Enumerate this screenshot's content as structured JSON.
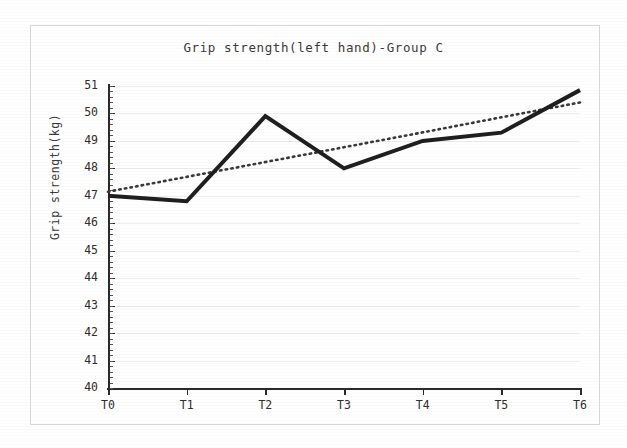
{
  "chart_data": {
    "type": "line",
    "title": "Grip strength(left hand)-Group C",
    "xlabel": "",
    "ylabel": "Grip strength(kg)",
    "categories": [
      "T0",
      "T1",
      "T2",
      "T3",
      "T4",
      "T5",
      "T6"
    ],
    "ylim": [
      40,
      51
    ],
    "xlim": [
      0,
      6
    ],
    "ytick_labels": [
      "51",
      "50",
      "49",
      "48",
      "47",
      "46",
      "45",
      "44",
      "43",
      "42",
      "41",
      "40"
    ],
    "ytick_values": [
      51,
      50,
      49,
      48,
      47,
      46,
      45,
      44,
      43,
      42,
      41,
      40
    ],
    "grid": "horizontal",
    "legend": "none",
    "series": [
      {
        "name": "Grip strength (left hand)",
        "style": "solid",
        "color": "#1f1f1f",
        "width": 4,
        "values": [
          47.0,
          46.8,
          49.9,
          48.0,
          49.0,
          49.3,
          50.85
        ]
      },
      {
        "name": "Linear trendline",
        "style": "dotted",
        "color": "#3a3a3a",
        "width": 2.6,
        "values": [
          47.15,
          47.69,
          48.23,
          48.77,
          49.31,
          49.86,
          50.4
        ]
      }
    ]
  },
  "figure": {
    "background_color": "#ffffff",
    "frame_color": "#d8d8d8",
    "axis_color": "#2b2b2b",
    "gridline_color": "#eceef2",
    "text_color": "#2e2e2e"
  }
}
